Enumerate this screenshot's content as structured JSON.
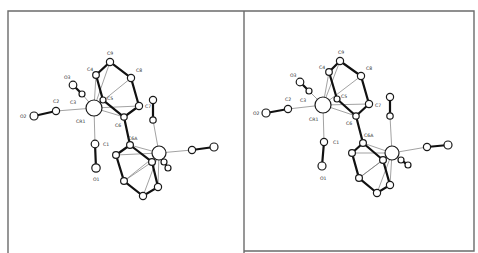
{
  "figure": {
    "panels": [
      {
        "id": "left",
        "labels": [
          {
            "text": "C9",
            "x": 107,
            "y": 55
          },
          {
            "text": "C4",
            "x": 87,
            "y": 71
          },
          {
            "text": "C8",
            "x": 136,
            "y": 72
          },
          {
            "text": "O3",
            "x": 64,
            "y": 79
          },
          {
            "text": "C2",
            "x": 53,
            "y": 103
          },
          {
            "text": "C3",
            "x": 70,
            "y": 104
          },
          {
            "text": "C5",
            "x": 107,
            "y": 100
          },
          {
            "text": "C7",
            "x": 145,
            "y": 108
          },
          {
            "text": "O2",
            "x": 20,
            "y": 118
          },
          {
            "text": "CR1",
            "x": 76,
            "y": 123
          },
          {
            "text": "C6",
            "x": 115,
            "y": 127
          },
          {
            "text": "C6A",
            "x": 128,
            "y": 140
          },
          {
            "text": "C1",
            "x": 103,
            "y": 146
          },
          {
            "text": "O1",
            "x": 93,
            "y": 181
          }
        ]
      },
      {
        "id": "right",
        "labels": [
          {
            "text": "C9",
            "x": 338,
            "y": 54
          },
          {
            "text": "C4",
            "x": 319,
            "y": 69
          },
          {
            "text": "C8",
            "x": 366,
            "y": 70
          },
          {
            "text": "O3",
            "x": 290,
            "y": 77
          },
          {
            "text": "C2",
            "x": 285,
            "y": 101
          },
          {
            "text": "C3",
            "x": 300,
            "y": 102
          },
          {
            "text": "C5",
            "x": 341,
            "y": 98
          },
          {
            "text": "C7",
            "x": 375,
            "y": 107
          },
          {
            "text": "O2",
            "x": 253,
            "y": 115
          },
          {
            "text": "CR1",
            "x": 309,
            "y": 121
          },
          {
            "text": "C6",
            "x": 346,
            "y": 125
          },
          {
            "text": "C6A",
            "x": 364,
            "y": 137
          },
          {
            "text": "C1",
            "x": 333,
            "y": 144
          },
          {
            "text": "O1",
            "x": 320,
            "y": 180
          }
        ]
      }
    ]
  }
}
